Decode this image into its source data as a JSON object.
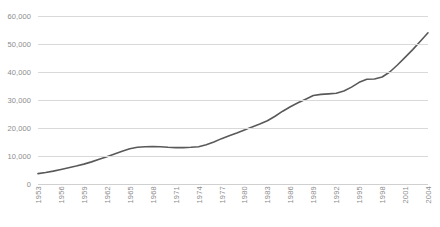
{
  "chart_data": {
    "type": "line",
    "title": "",
    "xlabel": "",
    "ylabel": "",
    "ylim": [
      0,
      60000
    ],
    "xlim": [
      1953,
      2004
    ],
    "grid": true,
    "legend": false,
    "y_ticks": [
      60000,
      50000,
      40000,
      30000,
      20000,
      10000,
      0
    ],
    "y_tick_labels": [
      "60,000",
      "50,000",
      "40,000",
      "30,000",
      "20,000",
      "10,000",
      "0"
    ],
    "x_tick_labels": [
      "1953",
      "1956",
      "1959",
      "1962",
      "1965",
      "1968",
      "1971",
      "1974",
      "1977",
      "1980",
      "1983",
      "1986",
      "1989",
      "1992",
      "1995",
      "1998",
      "2001",
      "2004"
    ],
    "series": [
      {
        "name": "Series 1",
        "color": "#595959",
        "x": [
          1953,
          1954,
          1955,
          1956,
          1957,
          1958,
          1959,
          1960,
          1961,
          1962,
          1963,
          1964,
          1965,
          1966,
          1967,
          1968,
          1969,
          1970,
          1971,
          1972,
          1973,
          1974,
          1975,
          1976,
          1977,
          1978,
          1979,
          1980,
          1981,
          1982,
          1983,
          1984,
          1985,
          1986,
          1987,
          1988,
          1989,
          1990,
          1991,
          1992,
          1993,
          1994,
          1995,
          1996,
          1997,
          1998,
          1999,
          2000,
          2001,
          2002,
          2003,
          2004
        ],
        "values": [
          3700,
          4100,
          4600,
          5200,
          5800,
          6400,
          7100,
          7900,
          8800,
          9700,
          10700,
          11700,
          12600,
          13100,
          13300,
          13400,
          13300,
          13100,
          13000,
          13000,
          13100,
          13300,
          14000,
          15000,
          16200,
          17200,
          18200,
          19300,
          20400,
          21400,
          22600,
          24200,
          26000,
          27600,
          29000,
          30300,
          31600,
          32000,
          32200,
          32400,
          33200,
          34600,
          36300,
          37400,
          37500,
          38200,
          40000,
          42500,
          45200,
          48000,
          51000,
          54000
        ]
      }
    ]
  },
  "axis_style": {
    "gridline_color": "#d9d9d9",
    "label_color": "#8c8c8c",
    "line_color": "#595959"
  }
}
